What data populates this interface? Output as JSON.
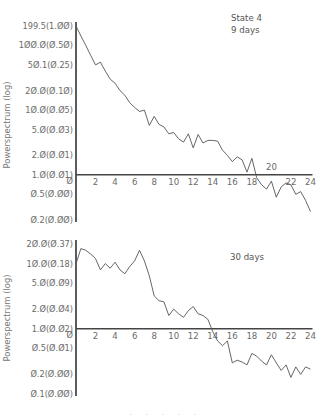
{
  "chart_data": [
    {
      "type": "line",
      "title": "State 4",
      "annotation": [
        "State 4",
        "9 days"
      ],
      "xlabel": "",
      "ylabel": "Powerspectrum (log)",
      "yscale": "log",
      "y_ticks": [
        {
          "value": 199.5,
          "label": "199.5(1.00)"
        },
        {
          "value": 100.0,
          "label": "100.0(0.50)"
        },
        {
          "value": 50.1,
          "label": "50.1(0.25)"
        },
        {
          "value": 20.0,
          "label": "20.0(0.10)"
        },
        {
          "value": 10.0,
          "label": "10.0(0.05)"
        },
        {
          "value": 5.0,
          "label": "5.0(0.03)"
        },
        {
          "value": 2.0,
          "label": "2.0(0.01)"
        },
        {
          "value": 1.0,
          "label": "1.0(0.01)"
        },
        {
          "value": 0.5,
          "label": "0.5(0.00)"
        },
        {
          "value": 0.2,
          "label": "0.2(0.00)"
        }
      ],
      "x_ticks": [
        "0",
        "2",
        "4",
        "6",
        "8",
        "10",
        "12",
        "14",
        "16",
        "18",
        "20",
        "22",
        "24"
      ],
      "xlim": [
        0,
        24
      ],
      "ylim": [
        0.2,
        199.5
      ],
      "grid": false,
      "x": [
        0,
        0.5,
        1,
        1.5,
        2,
        2.5,
        3,
        3.5,
        4,
        4.5,
        5,
        5.5,
        6,
        6.5,
        7,
        7.5,
        8,
        8.5,
        9,
        9.5,
        10,
        10.5,
        11,
        11.5,
        12,
        12.5,
        13,
        13.5,
        14,
        14.5,
        15,
        15.5,
        16,
        16.5,
        17,
        17.5,
        18,
        18.5,
        19,
        19.5,
        20,
        20.5,
        21,
        21.5,
        22,
        22.5,
        23,
        23.5,
        24
      ],
      "values": [
        199.5,
        140,
        100,
        70,
        50,
        55,
        40,
        30,
        26,
        20,
        17,
        13,
        11,
        9.5,
        10,
        5.8,
        8,
        6,
        5.5,
        4.3,
        4.5,
        3.6,
        3.2,
        4.3,
        2.6,
        4.2,
        3.1,
        3.4,
        3.4,
        3.3,
        2.4,
        2.0,
        1.6,
        1.9,
        1.7,
        1.1,
        1.8,
        0.9,
        0.7,
        0.6,
        0.8,
        0.45,
        0.65,
        0.75,
        0.7,
        0.5,
        0.55,
        0.4,
        0.27
      ]
    },
    {
      "type": "line",
      "title": "30 days",
      "annotation": [
        "30 days"
      ],
      "xlabel": "",
      "ylabel": "Powerspectrum (log)",
      "yscale": "log",
      "y_ticks": [
        {
          "value": 20.0,
          "label": "20.0(0.37)"
        },
        {
          "value": 10.0,
          "label": "10.0(0.18)"
        },
        {
          "value": 5.0,
          "label": "5.0(0.09)"
        },
        {
          "value": 2.0,
          "label": "2.0(0.04)"
        },
        {
          "value": 1.0,
          "label": "1.0(0.02)"
        },
        {
          "value": 0.5,
          "label": "0.5(0.01)"
        },
        {
          "value": 0.2,
          "label": "0.2(0.00)"
        },
        {
          "value": 0.1,
          "label": "0.1(0.00)"
        }
      ],
      "x_ticks": [
        "0",
        "2",
        "4",
        "6",
        "8",
        "10",
        "12",
        "14",
        "16",
        "18",
        "20",
        "22",
        "24"
      ],
      "xlim": [
        0,
        24
      ],
      "ylim": [
        0.1,
        20
      ],
      "grid": false,
      "x": [
        0,
        0.5,
        1,
        1.5,
        2,
        2.5,
        3,
        3.5,
        4,
        4.5,
        5,
        5.5,
        6,
        6.5,
        7,
        7.5,
        8,
        8.5,
        9,
        9.5,
        10,
        10.5,
        11,
        11.5,
        12,
        12.5,
        13,
        13.5,
        14,
        14.5,
        15,
        15.5,
        16,
        16.5,
        17,
        17.5,
        18,
        18.5,
        19,
        19.5,
        20,
        20.5,
        21,
        21.5,
        22,
        22.5,
        23,
        23.5,
        24
      ],
      "values": [
        10,
        17,
        16,
        14,
        12,
        8,
        10,
        8.5,
        10.5,
        8,
        7,
        9,
        11,
        16,
        11,
        6.5,
        3.2,
        2.7,
        2.6,
        1.6,
        2.0,
        1.7,
        1.5,
        1.9,
        2.2,
        1.7,
        1.6,
        1.4,
        0.9,
        0.65,
        0.55,
        0.65,
        0.3,
        0.33,
        0.31,
        0.28,
        0.42,
        0.38,
        0.32,
        0.28,
        0.4,
        0.3,
        0.23,
        0.28,
        0.18,
        0.26,
        0.2,
        0.26,
        0.24
      ]
    }
  ],
  "caption_fragment": "- - - - -"
}
